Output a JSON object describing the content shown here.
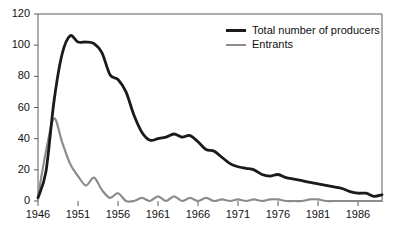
{
  "chart_data": {
    "type": "line",
    "title": "",
    "subtitle": "",
    "xlabel": "",
    "ylabel": "",
    "xlim": [
      1946,
      1989
    ],
    "ylim": [
      0,
      120
    ],
    "grid": false,
    "legend_position": "top-right",
    "x_ticks": [
      "1946",
      "1951",
      "1956",
      "1961",
      "1966",
      "1971",
      "1976",
      "1981",
      "1986"
    ],
    "x_tick_values": [
      1946,
      1951,
      1956,
      1961,
      1966,
      1971,
      1976,
      1981,
      1986
    ],
    "y_ticks": [
      "0",
      "20",
      "40",
      "60",
      "80",
      "100",
      "120"
    ],
    "y_tick_values": [
      0,
      20,
      40,
      60,
      80,
      100,
      120
    ],
    "x": [
      1946,
      1947,
      1948,
      1949,
      1950,
      1951,
      1952,
      1953,
      1954,
      1955,
      1956,
      1957,
      1958,
      1959,
      1960,
      1961,
      1962,
      1963,
      1964,
      1965,
      1966,
      1967,
      1968,
      1969,
      1970,
      1971,
      1972,
      1973,
      1974,
      1975,
      1976,
      1977,
      1978,
      1979,
      1980,
      1981,
      1982,
      1983,
      1984,
      1985,
      1986,
      1987,
      1988,
      1989
    ],
    "series": [
      {
        "name": "Total number of producers",
        "color": "#1a1a1a",
        "values": [
          2,
          19,
          64,
          94,
          106,
          102,
          102,
          101,
          95,
          81,
          78,
          70,
          55,
          44,
          39,
          40,
          41,
          43,
          41,
          42,
          38,
          33,
          32,
          28,
          24,
          22,
          21,
          20,
          17,
          16,
          17,
          15,
          14,
          13,
          12,
          11,
          10,
          9,
          8,
          6,
          5,
          5,
          3,
          4
        ]
      },
      {
        "name": "Entrants",
        "color": "#8c8c8c",
        "values": [
          3,
          32,
          53,
          38,
          24,
          16,
          10,
          15,
          7,
          2,
          5,
          0,
          0,
          2,
          0,
          3,
          0,
          3,
          0,
          2,
          0,
          2,
          0,
          1,
          0,
          1,
          0,
          1,
          0,
          1,
          1,
          0,
          0,
          0,
          1,
          1,
          0,
          0,
          0,
          0,
          0,
          0,
          0,
          0
        ]
      }
    ],
    "colors": {
      "producers": "#1a1a1a",
      "entrants": "#8c8c8c",
      "axis": "#5a5a5a",
      "text": "#111111",
      "background": "#ffffff"
    },
    "legend": [
      {
        "label": "Total number of producers",
        "color": "#1a1a1a",
        "swatch": "series-producers"
      },
      {
        "label": "Entrants",
        "color": "#8c8c8c",
        "swatch": "series-entrants"
      }
    ]
  }
}
